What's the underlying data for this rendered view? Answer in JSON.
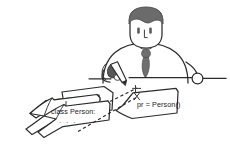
{
  "scene": {
    "title": "Hand-drawn sketch: person at desk with code papers",
    "width": 230,
    "height": 146,
    "background_color": "#ffffff"
  },
  "colors": {
    "ink": "#2b2b2b",
    "hair": "#6b6b6b",
    "tie": "#6f6f6f",
    "pen": "#4a4a4a",
    "paper": "#ffffff",
    "text": "#232323"
  },
  "person": {
    "label": "seated person",
    "hair_label": "hair",
    "face_label": "face",
    "eye_left_label": "left eye",
    "eye_right_label": "right eye",
    "nose_label": "nose",
    "tie_label": "necktie",
    "body_label": "torso",
    "left_arm_label": "left arm",
    "right_arm_label": "right arm",
    "left_hand_label": "left hand holding pen",
    "right_hand_label": "right hand",
    "pen_label": "pen"
  },
  "desk": {
    "label": "desk edge line"
  },
  "papers": {
    "left_stack_label": "stack of papers on the left",
    "right_sheet_label": "sheet of paper on the right",
    "left_code": "class Person:",
    "left_code_continuation": ". . .",
    "right_code": "pr = Person()"
  },
  "annotations": {
    "arrow_label": "dashed pointer from pen to left paper",
    "arrow2_label": "dashed pointer from pen tip downward"
  }
}
